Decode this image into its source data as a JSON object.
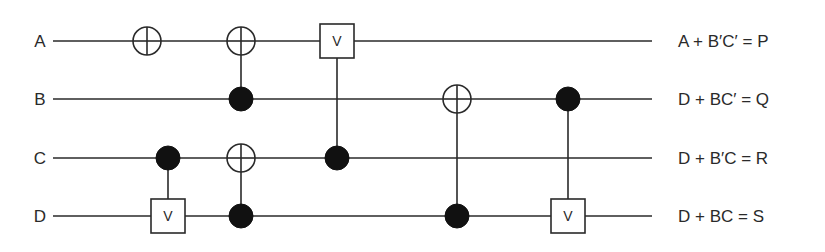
{
  "diagram": {
    "type": "reversible-logic-circuit",
    "colors": {
      "line": "#2a2a2a",
      "background": "#ffffff",
      "fill": "#111111"
    },
    "wires": [
      {
        "id": "A",
        "input_label": "A",
        "output_label": "A + B′C′ = P",
        "y": 41
      },
      {
        "id": "B",
        "input_label": "B",
        "output_label": "D + BC′ = Q",
        "y": 99
      },
      {
        "id": "C",
        "input_label": "C",
        "output_label": "D + B′C = R",
        "y": 158
      },
      {
        "id": "D",
        "input_label": "D",
        "output_label": "D + BC = S",
        "y": 216
      }
    ],
    "gates": [
      {
        "kind": "not",
        "x": 147,
        "target": "A",
        "controls": []
      },
      {
        "kind": "cnot",
        "x": 241,
        "target": "A",
        "controls": [
          "B"
        ]
      },
      {
        "kind": "controlled-v",
        "x": 168,
        "target": "D",
        "controls": [
          "C"
        ],
        "label": "V"
      },
      {
        "kind": "cnot",
        "x": 241,
        "target": "C",
        "controls": [
          "D"
        ]
      },
      {
        "kind": "controlled-v",
        "x": 337,
        "target": "A",
        "controls": [
          "C"
        ],
        "label": "V"
      },
      {
        "kind": "cnot",
        "x": 457,
        "target": "B",
        "controls": [
          "D"
        ]
      },
      {
        "kind": "controlled-v",
        "x": 568,
        "target": "D",
        "controls": [
          "B"
        ],
        "label": "V"
      }
    ]
  }
}
